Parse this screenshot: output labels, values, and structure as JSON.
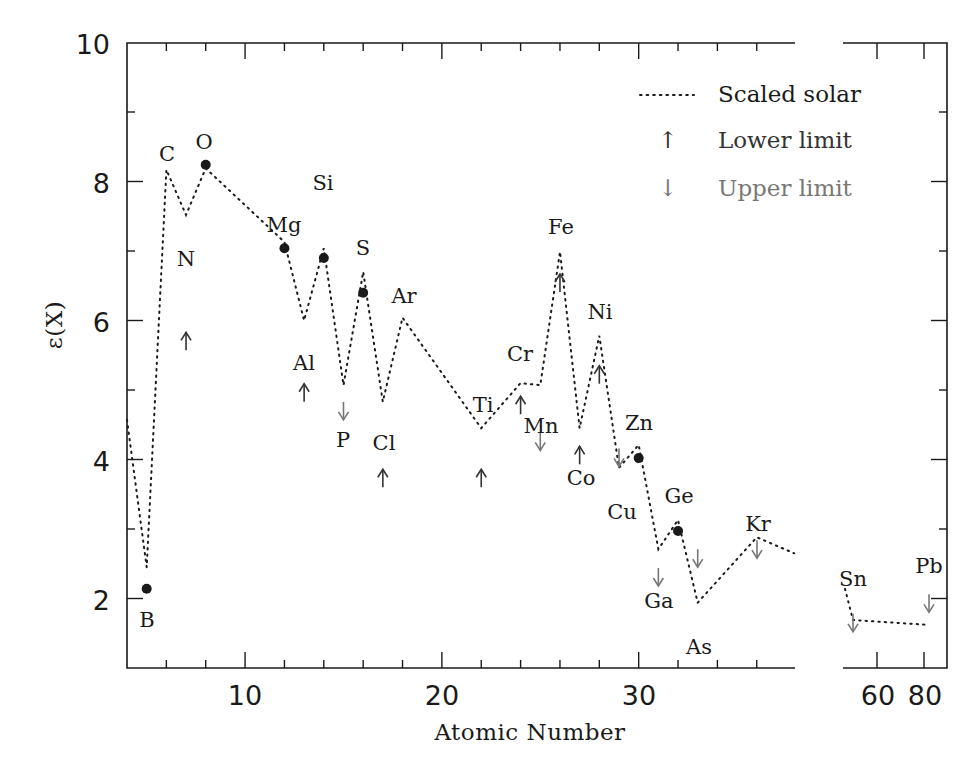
{
  "chart_data": {
    "type": "line",
    "title": "",
    "xlabel": "Atomic Number",
    "ylabel": "ε(X)",
    "ylim": [
      1,
      10
    ],
    "xlim_main": [
      4,
      37.9
    ],
    "xlim_break_panel": [
      50,
      90
    ],
    "x_ticks_main": [
      10,
      20,
      30
    ],
    "x_ticks_break_panel": [
      60,
      80
    ],
    "y_ticks": [
      2,
      4,
      6,
      8,
      10
    ],
    "grid": false,
    "legend_position": "upper right",
    "legend": [
      {
        "label": "Scaled solar",
        "marker": "dotted-line",
        "color": "#1a1a1a"
      },
      {
        "label": "Lower limit",
        "marker": "up-arrow",
        "color": "#333333"
      },
      {
        "label": "Upper limit",
        "marker": "down-arrow",
        "color": "#777777"
      }
    ],
    "series": [
      {
        "name": "Scaled solar",
        "style": "dotted",
        "points": [
          {
            "z": 4,
            "y": 4.57
          },
          {
            "z": 5,
            "y": 2.45
          },
          {
            "z": 6,
            "y": 8.17
          },
          {
            "z": 7,
            "y": 7.52
          },
          {
            "z": 8,
            "y": 8.19
          },
          {
            "z": 12,
            "y": 7.13
          },
          {
            "z": 13,
            "y": 6.0
          },
          {
            "z": 14,
            "y": 7.04
          },
          {
            "z": 15,
            "y": 5.07
          },
          {
            "z": 16,
            "y": 6.7
          },
          {
            "z": 17,
            "y": 4.83
          },
          {
            "z": 18,
            "y": 6.04
          },
          {
            "z": 22,
            "y": 4.45
          },
          {
            "z": 24,
            "y": 5.1
          },
          {
            "z": 25,
            "y": 5.07
          },
          {
            "z": 26,
            "y": 6.99
          },
          {
            "z": 27,
            "y": 4.45
          },
          {
            "z": 28,
            "y": 5.78
          },
          {
            "z": 29,
            "y": 3.88
          },
          {
            "z": 30,
            "y": 4.21
          },
          {
            "z": 31,
            "y": 2.71
          },
          {
            "z": 32,
            "y": 3.13
          },
          {
            "z": 33,
            "y": 1.94
          },
          {
            "z": 36,
            "y": 2.88
          },
          {
            "z": 37.9,
            "y": 2.65
          }
        ],
        "points_break_panel": [
          {
            "z": 50,
            "y": 2.14
          },
          {
            "z": 51,
            "y": 1.69
          },
          {
            "z": 82,
            "y": 1.62
          }
        ]
      },
      {
        "name": "Measured",
        "style": "filled-circle",
        "points": [
          {
            "element": "B",
            "z": 5,
            "y": 2.14
          },
          {
            "element": "O",
            "z": 8,
            "y": 8.24
          },
          {
            "element": "Mg",
            "z": 12,
            "y": 7.04
          },
          {
            "element": "Si",
            "z": 14,
            "y": 6.9
          },
          {
            "element": "S",
            "z": 16,
            "y": 6.4
          },
          {
            "element": "Zn",
            "z": 30,
            "y": 4.02
          },
          {
            "element": "Ge",
            "z": 32,
            "y": 2.97
          }
        ]
      },
      {
        "name": "Lower limit",
        "style": "up-arrow",
        "points": [
          {
            "element": "N",
            "z": 7,
            "y": 5.7
          },
          {
            "element": "Al",
            "z": 13,
            "y": 4.96
          },
          {
            "element": "Cl",
            "z": 17,
            "y": 3.73
          },
          {
            "element": "Ti",
            "z": 22,
            "y": 3.73
          },
          {
            "element": "Cr",
            "z": 24,
            "y": 4.78
          },
          {
            "element": "Fe",
            "z": 26,
            "y": 6.54
          },
          {
            "element": "Co",
            "z": 27,
            "y": 4.06
          },
          {
            "element": "Ni",
            "z": 28,
            "y": 5.22
          }
        ]
      },
      {
        "name": "Upper limit",
        "style": "down-arrow",
        "points": [
          {
            "element": "P",
            "z": 15,
            "y": 4.7
          },
          {
            "element": "Mn",
            "z": 25,
            "y": 4.26
          },
          {
            "element": "Cu",
            "z": 29,
            "y": 4.03
          },
          {
            "element": "Ga",
            "z": 31,
            "y": 2.31
          },
          {
            "element": "As",
            "z": 33,
            "y": 2.58
          },
          {
            "element": "Kr",
            "z": 36,
            "y": 2.71
          },
          {
            "element": "Sn",
            "z": 51,
            "y": 1.65
          },
          {
            "element": "Pb",
            "z": 82,
            "y": 1.93
          }
        ]
      }
    ],
    "element_labels": [
      {
        "text": "B",
        "px": 147,
        "py": 627
      },
      {
        "text": "C",
        "px": 167,
        "py": 161
      },
      {
        "text": "O",
        "px": 204,
        "py": 149
      },
      {
        "text": "N",
        "px": 186,
        "py": 266
      },
      {
        "text": "Mg",
        "px": 284,
        "py": 232
      },
      {
        "text": "Si",
        "px": 323,
        "py": 190
      },
      {
        "text": "S",
        "px": 363,
        "py": 255
      },
      {
        "text": "Ar",
        "px": 404,
        "py": 303
      },
      {
        "text": "Al",
        "px": 304,
        "py": 370
      },
      {
        "text": "P",
        "px": 343,
        "py": 447
      },
      {
        "text": "Cl",
        "px": 384,
        "py": 450
      },
      {
        "text": "Ti",
        "px": 483,
        "py": 412
      },
      {
        "text": "Cr",
        "px": 520,
        "py": 361
      },
      {
        "text": "Mn",
        "px": 541,
        "py": 433
      },
      {
        "text": "Fe",
        "px": 561,
        "py": 234
      },
      {
        "text": "Ni",
        "px": 600,
        "py": 319
      },
      {
        "text": "Co",
        "px": 581,
        "py": 485
      },
      {
        "text": "Zn",
        "px": 639,
        "py": 430
      },
      {
        "text": "Cu",
        "px": 622,
        "py": 519
      },
      {
        "text": "Ge",
        "px": 679,
        "py": 503
      },
      {
        "text": "Ga",
        "px": 659,
        "py": 608
      },
      {
        "text": "As",
        "px": 699,
        "py": 654
      },
      {
        "text": "Kr",
        "px": 758,
        "py": 531
      },
      {
        "text": "Sn",
        "px": 853,
        "py": 586
      },
      {
        "text": "Pb",
        "px": 929,
        "py": 573
      }
    ]
  },
  "axes": {
    "y_tick_labels": [
      "2",
      "4",
      "6",
      "8",
      "10"
    ],
    "x_tick_labels": [
      "10",
      "20",
      "30"
    ],
    "x_break_tick_labels": [
      "60",
      "80"
    ],
    "xlabel": "Atomic Number",
    "ylabel": "ε(X)"
  },
  "legend": {
    "scaled_solar": "Scaled solar",
    "lower_limit": "Lower limit",
    "upper_limit": "Upper limit",
    "up_arrow_glyph": "↑",
    "down_arrow_glyph": "↓"
  },
  "colors": {
    "ink": "#1a1a1a",
    "lower_limit": "#333333",
    "upper_limit": "#777777"
  }
}
